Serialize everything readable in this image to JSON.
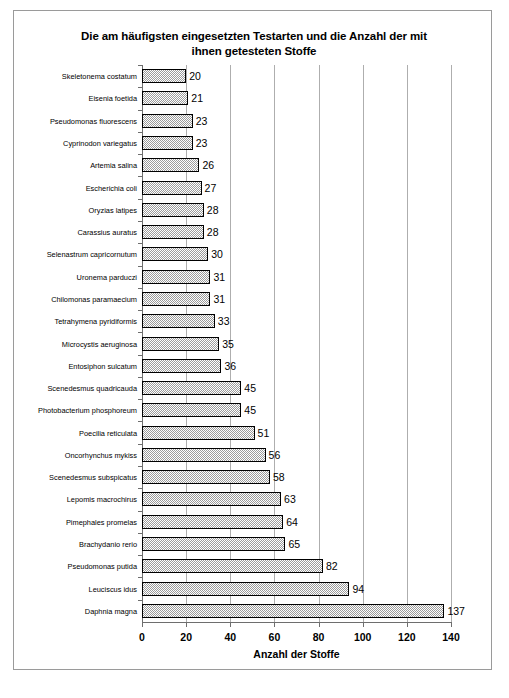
{
  "chart_data": {
    "type": "bar",
    "orientation": "horizontal",
    "title": "Die am häufigsten eingesetzten Testarten und die Anzahl der mit ihnen getesteten Stoffe",
    "title_line1": "Die am häufigsten eingesetzten Testarten und die Anzahl der mit",
    "title_line2": "ihnen getesteten Stoffe",
    "xlabel": "Anzahl der Stoffe",
    "ylabel": "",
    "xlim": [
      0,
      140
    ],
    "xticks": [
      0,
      20,
      40,
      60,
      80,
      100,
      120,
      140
    ],
    "xticklabels": [
      "0",
      "20",
      "40",
      "60",
      "80",
      "100",
      "120",
      "140"
    ],
    "grid": "vertical",
    "legend": "none",
    "bar_fill_color": "#9c9c9c",
    "bar_edge_color": "#000000",
    "data_labels": true,
    "categories": [
      "Skeletonema costatum",
      "Eisenia foetida",
      "Pseudomonas fluorescens",
      "Cyprinodon variegatus",
      "Artemia salina",
      "Escherichia coli",
      "Oryzias latipes",
      "Carassius auratus",
      "Selenastrum capricornutum",
      "Uronema parduczi",
      "Chilomonas paramaecium",
      "Tetrahymena pyridiformis",
      "Microcystis aeruginosa",
      "Entosiphon sulcatum",
      "Scenedesmus quadricauda",
      "Photobacterium phosphoreum",
      "Poecilia reticulata",
      "Oncorhynchus mykiss",
      "Scenedesmus subspicatus",
      "Lepomis macrochirus",
      "Pimephales promelas",
      "Brachydanio rerio",
      "Pseudomonas putida",
      "Leuciscus idus",
      "Daphnia magna"
    ],
    "values": [
      20,
      21,
      23,
      23,
      26,
      27,
      28,
      28,
      30,
      31,
      31,
      33,
      35,
      36,
      45,
      45,
      51,
      56,
      58,
      63,
      64,
      65,
      82,
      94,
      137
    ]
  }
}
